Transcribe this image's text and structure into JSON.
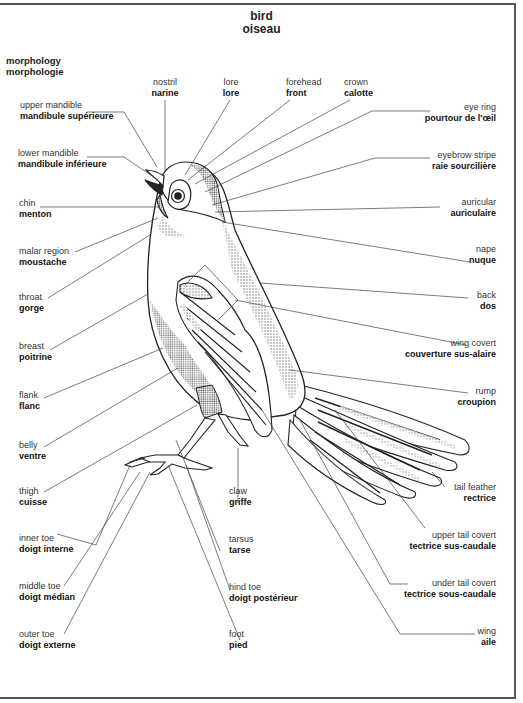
{
  "title": {
    "en": "bird",
    "fr": "oiseau"
  },
  "section": {
    "en": "morphology",
    "fr": "morphologie"
  },
  "labels": {
    "upper_mandible": {
      "en": "upper mandible",
      "fr": "mandibule supérieure"
    },
    "lower_mandible": {
      "en": "lower mandible",
      "fr": "mandibule inférieure"
    },
    "chin": {
      "en": "chin",
      "fr": "menton"
    },
    "malar_region": {
      "en": "malar region",
      "fr": "moustache"
    },
    "throat": {
      "en": "throat",
      "fr": "gorge"
    },
    "breast": {
      "en": "breast",
      "fr": "poitrine"
    },
    "flank": {
      "en": "flank",
      "fr": "flanc"
    },
    "belly": {
      "en": "belly",
      "fr": "ventre"
    },
    "thigh": {
      "en": "thigh",
      "fr": "cuisse"
    },
    "inner_toe": {
      "en": "inner toe",
      "fr": "doigt interne"
    },
    "middle_toe": {
      "en": "middle toe",
      "fr": "doigt médian"
    },
    "outer_toe": {
      "en": "outer toe",
      "fr": "doigt externe"
    },
    "nostril": {
      "en": "nostril",
      "fr": "narine"
    },
    "lore": {
      "en": "lore",
      "fr": "lore"
    },
    "forehead": {
      "en": "forehead",
      "fr": "front"
    },
    "crown": {
      "en": "crown",
      "fr": "calotte"
    },
    "eye_ring": {
      "en": "eye ring",
      "fr": "pourtour de l'œil"
    },
    "eyebrow_stripe": {
      "en": "eyebrow stripe",
      "fr": "raie sourcilière"
    },
    "auricular": {
      "en": "auricular",
      "fr": "auriculaire"
    },
    "nape": {
      "en": "nape",
      "fr": "nuque"
    },
    "back": {
      "en": "back",
      "fr": "dos"
    },
    "wing_covert": {
      "en": "wing covert",
      "fr": "couverture sus-alaire"
    },
    "rump": {
      "en": "rump",
      "fr": "croupion"
    },
    "tail_feather": {
      "en": "tail feather",
      "fr": "rectrice"
    },
    "upper_tail_covert": {
      "en": "upper tail covert",
      "fr": "tectrice sus-caudale"
    },
    "under_tail_covert": {
      "en": "under tail covert",
      "fr": "tectrice sous-caudale"
    },
    "wing": {
      "en": "wing",
      "fr": "aile"
    },
    "claw": {
      "en": "claw",
      "fr": "griffe"
    },
    "tarsus": {
      "en": "tarsus",
      "fr": "tarse"
    },
    "hind_toe": {
      "en": "hind toe",
      "fr": "doigt postérieur"
    },
    "foot": {
      "en": "foot",
      "fr": "pied"
    }
  }
}
